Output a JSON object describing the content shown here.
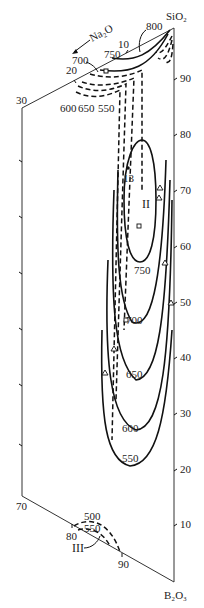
{
  "diagram": {
    "type": "ternary-phase-diagram-section",
    "components": {
      "top": "SiO₂",
      "bottom": "B₂O₃",
      "side_axis": "Na₂O"
    },
    "na2o_axis": {
      "label": "Na₂O",
      "ticks": [
        "10",
        "20",
        "30"
      ]
    },
    "left_edge": {
      "ticks": [
        "30",
        "70"
      ]
    },
    "bottom_edge": {
      "ticks": [
        "70",
        "80",
        "90"
      ]
    },
    "sio2_axis": {
      "ticks": [
        "90",
        "80",
        "70",
        "60",
        "50",
        "40",
        "30",
        "20",
        "10"
      ]
    },
    "isotherms_upper": [
      "800",
      "750",
      "700",
      "650",
      "600",
      "550"
    ],
    "isotherms_main": [
      "750",
      "700",
      "650",
      "600",
      "550"
    ],
    "isotherms_lower": [
      "500",
      "550"
    ],
    "regions": {
      "region_2": "II",
      "region_3": "III"
    },
    "point_label": "13",
    "line_styles": {
      "solid": "#111111",
      "dashed": "#111111"
    }
  }
}
